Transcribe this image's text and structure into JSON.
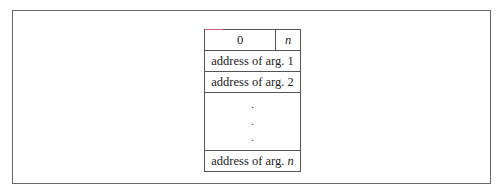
{
  "diagram": {
    "header": {
      "count_value": "0",
      "n_label": "n"
    },
    "rows": [
      {
        "text": "address of arg. 1"
      },
      {
        "text": "address of arg. 2"
      }
    ],
    "ellipsis": [
      ".",
      ".",
      "."
    ],
    "last_row": {
      "prefix": "address of arg. ",
      "suffix": "n"
    }
  }
}
